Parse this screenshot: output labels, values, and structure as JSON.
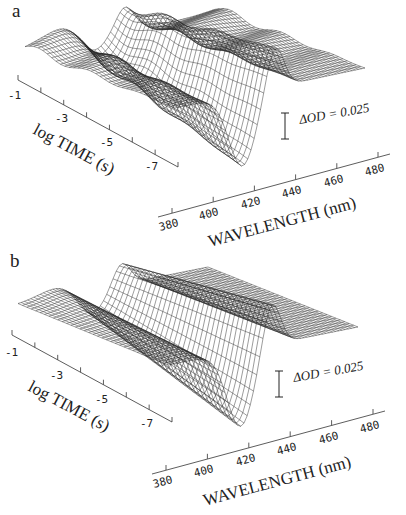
{
  "figure": {
    "panels": [
      {
        "id": "a",
        "letter": "a"
      },
      {
        "id": "b",
        "letter": "b"
      }
    ],
    "time_axis": {
      "title": "log TIME (s)",
      "ticks": [
        "-1",
        "-3",
        "-5",
        "-7"
      ]
    },
    "wavelength_axis": {
      "title": "WAVELENGTH (nm)",
      "ticks": [
        "380",
        "400",
        "420",
        "440",
        "460",
        "480"
      ]
    },
    "scale_bar_label": "ΔOD = 0.025"
  },
  "chart_data": [
    {
      "type": "surface",
      "title": "a",
      "xlabel": "WAVELENGTH (nm)",
      "ylabel": "log TIME (s)",
      "zlabel": "ΔOD",
      "x_ticks": [
        380,
        400,
        420,
        440,
        460,
        480
      ],
      "y_ticks": [
        -1,
        -3,
        -5,
        -7
      ],
      "xlim": [
        375,
        485
      ],
      "ylim": [
        -8,
        -1
      ],
      "scale_bar": {
        "label": "ΔOD = 0.025",
        "value": 0.025
      },
      "features": {
        "negative_bleach_minimum_nm": 415,
        "positive_peak_nm": 433,
        "description": "3D wireframe difference-spectra surface with bleach near 410-420 nm and positive band near 430-440 nm; multiple ridges across time"
      }
    },
    {
      "type": "surface",
      "title": "b",
      "xlabel": "WAVELENGTH (nm)",
      "ylabel": "log TIME (s)",
      "zlabel": "ΔOD",
      "x_ticks": [
        380,
        400,
        420,
        440,
        460,
        480
      ],
      "y_ticks": [
        -1,
        -3,
        -5,
        -7
      ],
      "xlim": [
        375,
        485
      ],
      "ylim": [
        -8,
        -1
      ],
      "scale_bar": {
        "label": "ΔOD = 0.025",
        "value": 0.025
      },
      "features": {
        "negative_bleach_minimum_nm": 418,
        "positive_peak_nm": 435,
        "description": "Smoothed fit surface of panel a; bleach near 415 nm and positive band near 435 nm"
      }
    }
  ]
}
